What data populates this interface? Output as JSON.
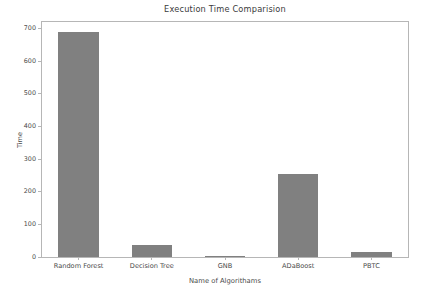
{
  "chart_data": {
    "type": "bar",
    "title": "Execution Time Comparision",
    "xlabel": "Name of Algorithams",
    "ylabel": "Time",
    "categories": [
      "Random Forest",
      "Decision Tree",
      "GNB",
      "ADaBoost",
      "PBTC"
    ],
    "values": [
      690,
      36,
      1,
      255,
      15
    ],
    "ylim": [
      0,
      720
    ],
    "yticks": [
      0,
      100,
      200,
      300,
      400,
      500,
      600,
      700
    ],
    "ytick_labels": [
      "0",
      "100",
      "200",
      "300",
      "400",
      "500",
      "600",
      "700"
    ],
    "xlim": [
      -0.5,
      4.5
    ],
    "grid": false,
    "legend": null,
    "bar_color": "#808080",
    "bar_width": 0.55,
    "axes_color": "#b6b6b6",
    "text_color": "#4a4a4a",
    "background": "#ffffff"
  }
}
